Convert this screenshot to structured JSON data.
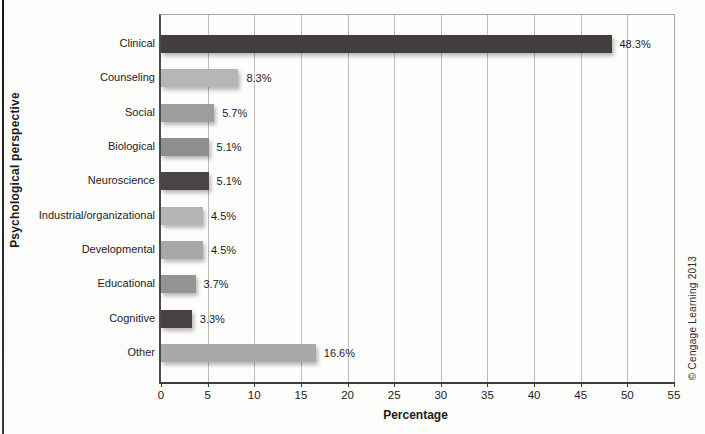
{
  "chart_data": {
    "type": "bar",
    "orientation": "horizontal",
    "title": "",
    "xlabel": "Percentage",
    "ylabel": "Psychological perspective",
    "xlim": [
      0,
      55
    ],
    "xticks": [
      0,
      5,
      10,
      15,
      20,
      25,
      30,
      35,
      40,
      45,
      50,
      55
    ],
    "grid": "vertical",
    "categories": [
      "Clinical",
      "Counseling",
      "Social",
      "Biological",
      "Neuroscience",
      "Industrial/organizational",
      "Developmental",
      "Educational",
      "Cognitive",
      "Other"
    ],
    "values": [
      48.3,
      8.3,
      5.7,
      5.1,
      5.1,
      4.5,
      4.5,
      3.7,
      3.3,
      16.6
    ],
    "value_labels": [
      "48.3%",
      "8.3%",
      "5.7%",
      "5.1%",
      "5.1%",
      "4.5%",
      "4.5%",
      "3.7%",
      "3.3%",
      "16.6%"
    ],
    "bar_colors": [
      "#433e3e",
      "#b6b6b6",
      "#9d9d9d",
      "#8e8e8e",
      "#4a4444",
      "#b4b4b4",
      "#a7a7a7",
      "#939393",
      "#484242",
      "#a9a9a9"
    ],
    "gridline_color": "#bcbcbc"
  },
  "copyright": "© Cengage Learning 2013"
}
